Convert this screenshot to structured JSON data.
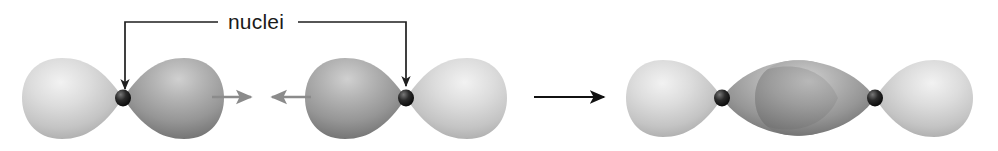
{
  "figure": {
    "title": "nuclei",
    "width": 998,
    "height": 151,
    "background_color": "#ffffff",
    "label": {
      "text": "nuclei",
      "color": "#1a1a1a",
      "x": 215,
      "y": 28,
      "font_size": 21
    },
    "colors": {
      "lobe_light": "#d2d2d2",
      "lobe_light_highlight": "#eeeeee",
      "lobe_light_shadow": "#a8a8a8",
      "lobe_dark": "#9e9e9e",
      "lobe_dark_highlight": "#c8c8c8",
      "lobe_dark_shadow": "#6e6e6e",
      "overlap": "#8a8a8a",
      "nucleus": "#151515",
      "nucleus_highlight": "#6a6a6a",
      "leader_line": "#1f1f1f",
      "arrow_gray": "#8b8b8b",
      "arrow_black": "#111111"
    },
    "leaders": [
      {
        "name": "left-leader",
        "from_x": 218,
        "horizontal_y": 22,
        "corner_x": 125,
        "arrow_tip_x": 125,
        "arrow_tip_y": 97,
        "target": "left-orbital-nucleus"
      },
      {
        "name": "right-leader",
        "from_x": 298,
        "horizontal_y": 22,
        "corner_x": 406,
        "arrow_tip_x": 406,
        "arrow_tip_y": 94,
        "target": "right-orbital-nucleus"
      }
    ],
    "arrows": [
      {
        "name": "left-motion-arrow",
        "style": "gray",
        "direction": "right",
        "tail_x": 212,
        "tip_x": 253,
        "y": 97
      },
      {
        "name": "right-motion-arrow",
        "style": "gray",
        "direction": "left",
        "tail_x": 311,
        "tip_x": 269,
        "y": 97
      },
      {
        "name": "reaction-arrow",
        "style": "black",
        "direction": "right",
        "tail_x": 534,
        "tip_x": 607,
        "y": 97
      }
    ],
    "orbitals": [
      {
        "name": "orbital-1",
        "nucleus_x": 123,
        "nucleus_y": 98,
        "lobes": [
          {
            "side": "left",
            "shade": "light",
            "tip_x": 123,
            "bulb_x": 24,
            "half_height": 42
          },
          {
            "side": "right",
            "shade": "dark",
            "tip_x": 123,
            "bulb_x": 222,
            "half_height": 42
          }
        ]
      },
      {
        "name": "orbital-2",
        "nucleus_x": 406,
        "nucleus_y": 98,
        "lobes": [
          {
            "side": "left",
            "shade": "dark",
            "tip_x": 406,
            "bulb_x": 308,
            "half_height": 42
          },
          {
            "side": "right",
            "shade": "light",
            "tip_x": 406,
            "bulb_x": 504,
            "half_height": 42
          }
        ]
      },
      {
        "name": "orbital-3-bonded-left",
        "nucleus_x": 722,
        "nucleus_y": 98,
        "lobes": [
          {
            "side": "left",
            "shade": "light",
            "tip_x": 722,
            "bulb_x": 626,
            "half_height": 40
          },
          {
            "side": "right",
            "shade": "dark",
            "tip_x": 722,
            "bulb_x": 838,
            "half_height": 40
          }
        ]
      },
      {
        "name": "orbital-3-bonded-right",
        "nucleus_x": 875,
        "nucleus_y": 98,
        "lobes": [
          {
            "side": "left",
            "shade": "dark",
            "tip_x": 875,
            "bulb_x": 760,
            "half_height": 40
          },
          {
            "side": "right",
            "shade": "light",
            "tip_x": 875,
            "bulb_x": 973,
            "half_height": 40
          }
        ]
      }
    ],
    "overlap_region": {
      "name": "sigma-overlap",
      "center_x": 799,
      "center_y": 98,
      "rx": 32,
      "ry": 44
    }
  }
}
